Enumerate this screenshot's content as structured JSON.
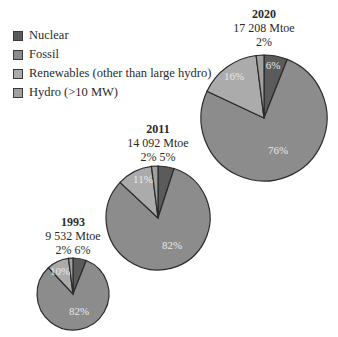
{
  "legend": {
    "items": [
      {
        "label": "Nuclear",
        "color": "#5b5b5b"
      },
      {
        "label": "Fossil",
        "color": "#8c8c8c"
      },
      {
        "label": "Renewables (other than large hydro)",
        "color": "#ababab"
      },
      {
        "label": "Hydro (>10 MW)",
        "color": "#a0a0a0"
      }
    ]
  },
  "pies": [
    {
      "year": "1993",
      "total": "9 532 Mtoe",
      "top_pcts": "2% 6%",
      "inner_labels": {
        "renewables": "10%",
        "fossil": "82%"
      }
    },
    {
      "year": "2011",
      "total": "14 092 Mtoe",
      "top_pcts": "2% 5%",
      "inner_labels": {
        "renewables": "11%",
        "fossil": "82%"
      }
    },
    {
      "year": "2020",
      "total": "17 208 Mtoe",
      "top_pcts": "2%",
      "inner_labels": {
        "nuclear": "6%",
        "renewables": "16%",
        "fossil": "76%"
      }
    }
  ],
  "chart_data": {
    "type": "pie",
    "title": "",
    "categories": [
      "Nuclear",
      "Fossil",
      "Renewables (other than large hydro)",
      "Hydro (>10 MW)"
    ],
    "series": [
      {
        "name": "1993",
        "total": "9 532 Mtoe",
        "values": [
          6,
          82,
          10,
          2
        ]
      },
      {
        "name": "2011",
        "total": "14 092 Mtoe",
        "values": [
          5,
          82,
          11,
          2
        ]
      },
      {
        "name": "2020",
        "total": "17 208 Mtoe",
        "values": [
          6,
          76,
          16,
          2
        ]
      }
    ],
    "legend_position": "top-left"
  }
}
